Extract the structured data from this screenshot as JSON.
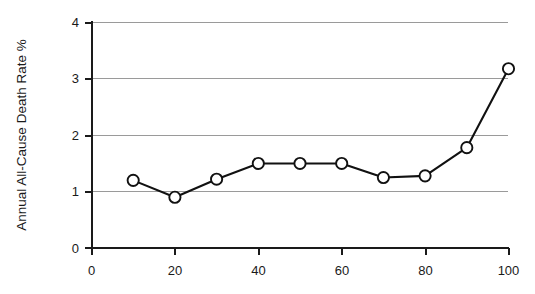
{
  "chart_data": {
    "type": "line",
    "title": "",
    "xlabel": "",
    "ylabel": "Annual All-Cause Death Rate %",
    "x": [
      10,
      20,
      30,
      40,
      50,
      60,
      70,
      80,
      90,
      100
    ],
    "values": [
      1.2,
      0.9,
      1.22,
      1.5,
      1.5,
      1.5,
      1.25,
      1.28,
      1.78,
      3.18
    ],
    "series": [
      {
        "name": "Annual All-Cause Death Rate %",
        "values": [
          1.2,
          0.9,
          1.22,
          1.5,
          1.5,
          1.5,
          1.25,
          1.28,
          1.78,
          3.18
        ]
      }
    ],
    "xlim": [
      0,
      100
    ],
    "ylim": [
      0,
      4
    ],
    "xticks": [
      0,
      20,
      40,
      60,
      80,
      100
    ],
    "yticks": [
      0,
      1,
      2,
      3,
      4
    ],
    "xticklabels": [
      "0",
      "20",
      "40",
      "60",
      "80",
      "100"
    ],
    "yticklabels": [
      "0",
      "1",
      "2",
      "3",
      "4"
    ],
    "grid": "horizontal",
    "grid_color": "#9a9a9a",
    "legend": "none",
    "marker": "open-circle",
    "line_color": "#111111",
    "marker_face_color": "#ffffff",
    "background_color": "#ffffff"
  },
  "axes": {
    "y_title": "Annual All-Cause Death Rate %",
    "x_title": ""
  }
}
